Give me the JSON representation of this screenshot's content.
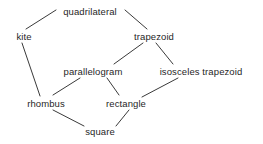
{
  "diagram": {
    "background_color": "#ffffff",
    "text_color": "#1f1f1f",
    "edge_color": "#3a3a3a",
    "nodes": [
      {
        "id": "quadrilateral",
        "label": "quadrilateral",
        "x": 90,
        "y": 11
      },
      {
        "id": "kite",
        "label": "kite",
        "x": 24,
        "y": 36
      },
      {
        "id": "trapezoid",
        "label": "trapezoid",
        "x": 154,
        "y": 36
      },
      {
        "id": "parallelogram",
        "label": "parallelogram",
        "x": 93,
        "y": 71
      },
      {
        "id": "isosceles_trapezoid",
        "label": "isosceles trapezoid",
        "x": 201,
        "y": 71
      },
      {
        "id": "rhombus",
        "label": "rhombus",
        "x": 46,
        "y": 103
      },
      {
        "id": "rectangle",
        "label": "rectangle",
        "x": 126,
        "y": 103
      },
      {
        "id": "square",
        "label": "square",
        "x": 100,
        "y": 131
      }
    ],
    "edges": [
      {
        "from": "quadrilateral",
        "to": "kite",
        "x1": 56,
        "y1": 10,
        "x2": 26,
        "y2": 29
      },
      {
        "from": "quadrilateral",
        "to": "trapezoid",
        "x1": 125,
        "y1": 10,
        "x2": 147,
        "y2": 29
      },
      {
        "from": "kite",
        "to": "rhombus",
        "x1": 22,
        "y1": 43,
        "x2": 40,
        "y2": 96
      },
      {
        "from": "trapezoid",
        "to": "parallelogram",
        "x1": 143,
        "y1": 43,
        "x2": 114,
        "y2": 64
      },
      {
        "from": "trapezoid",
        "to": "isosceles_trapezoid",
        "x1": 156,
        "y1": 43,
        "x2": 173,
        "y2": 64
      },
      {
        "from": "parallelogram",
        "to": "rhombus",
        "x1": 80,
        "y1": 78,
        "x2": 53,
        "y2": 95
      },
      {
        "from": "parallelogram",
        "to": "rectangle",
        "x1": 107,
        "y1": 78,
        "x2": 119,
        "y2": 95
      },
      {
        "from": "isosceles_trapezoid",
        "to": "rectangle",
        "x1": 178,
        "y1": 78,
        "x2": 142,
        "y2": 97
      },
      {
        "from": "rhombus",
        "to": "square",
        "x1": 53,
        "y1": 110,
        "x2": 84,
        "y2": 126
      },
      {
        "from": "rectangle",
        "to": "square",
        "x1": 129,
        "y1": 110,
        "x2": 116,
        "y2": 126
      }
    ]
  }
}
